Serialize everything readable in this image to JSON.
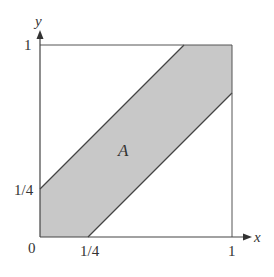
{
  "diagram": {
    "title": "",
    "region_label": "A",
    "axes": {
      "x_label": "x",
      "y_label": "y",
      "origin_label": "0",
      "x_ticks": [
        "1/4",
        "1"
      ],
      "y_ticks": [
        "1/4",
        "1"
      ]
    },
    "region": {
      "description": "Shaded band between lines y = x + 1/4 and y = x - 1/4 within the unit square",
      "upper_boundary": "y = x + 1/4",
      "lower_boundary": "y = x - 1/4",
      "fill_color": "#c8c8c8",
      "stroke_color": "#444444"
    },
    "square": {
      "x_range": [
        0,
        1
      ],
      "y_range": [
        0,
        1
      ]
    }
  }
}
